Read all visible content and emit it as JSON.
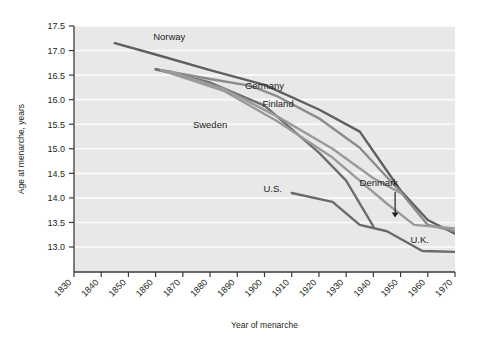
{
  "chart_data": {
    "type": "line",
    "title": "",
    "xlabel": "Year of menarche",
    "ylabel": "Age at menarche, years",
    "xlim": [
      1830,
      1970
    ],
    "ylim": [
      12.7,
      17.6
    ],
    "xticks": [
      1830,
      1840,
      1850,
      1860,
      1870,
      1880,
      1890,
      1900,
      1910,
      1920,
      1930,
      1940,
      1950,
      1960,
      1970
    ],
    "yticks": [
      13.0,
      13.5,
      14.0,
      14.5,
      15.0,
      15.5,
      16.0,
      16.5,
      17.0,
      17.5
    ],
    "grid": "horizontal-major-white",
    "plot_background": "#e8e8e8",
    "legend": "inline-labels",
    "series": [
      {
        "name": "Norway",
        "color": "#5f5f5f",
        "label_x": 1865,
        "label_y": 17.22,
        "x": [
          1845,
          1860,
          1880,
          1900,
          1920,
          1935,
          1950,
          1960,
          1970
        ],
        "y": [
          17.15,
          16.92,
          16.6,
          16.3,
          15.8,
          15.35,
          14.15,
          13.55,
          13.27
        ]
      },
      {
        "name": "Sweden",
        "color": "#8c8c8c",
        "label_x": 1880,
        "label_y": 15.42,
        "x": [
          1860,
          1880,
          1895,
          1905,
          1920,
          1935,
          1950,
          1960,
          1970
        ],
        "y": [
          16.62,
          16.42,
          16.28,
          16.06,
          15.62,
          15.02,
          14.12,
          13.45,
          13.32
        ]
      },
      {
        "name": "Germany",
        "color": "#6e6e6e",
        "label_x": 1900,
        "label_y": 16.22,
        "x": [
          1860,
          1880,
          1900,
          1920,
          1930,
          1940
        ],
        "y": [
          16.62,
          16.35,
          15.88,
          14.92,
          14.35,
          13.42
        ]
      },
      {
        "name": "Finland",
        "color": "#9a9a9a",
        "label_x": 1905,
        "label_y": 15.86,
        "x": [
          1865,
          1885,
          1905,
          1925,
          1940,
          1950
        ],
        "y": [
          16.58,
          16.22,
          15.65,
          15.0,
          14.4,
          14.1
        ]
      },
      {
        "name": "Denmark",
        "color": "#9a9a9a",
        "label_x": 1942,
        "label_y": 14.25,
        "arrow": true,
        "x": [
          1862,
          1885,
          1905,
          1925,
          1945,
          1955,
          1970
        ],
        "y": [
          16.6,
          16.18,
          15.55,
          14.82,
          13.88,
          13.45,
          13.38
        ]
      },
      {
        "name": "U.S.",
        "color": "#6a6a6a",
        "label_x": 1903,
        "label_y": 14.12,
        "x": [
          1910,
          1925,
          1935,
          1945,
          1958,
          1970
        ],
        "y": [
          14.1,
          13.92,
          13.45,
          13.32,
          12.92,
          12.9
        ]
      }
    ]
  },
  "labels": {
    "norway": "Norway",
    "sweden": "Sweden",
    "germany": "Germany",
    "finland": "Finland",
    "denmark": "Denmark",
    "us": "U.S.",
    "uk": "U.K."
  },
  "uk_label": {
    "text": "U.K.",
    "x": 1957,
    "y": 13.08
  },
  "axis": {
    "x_title": "Year of menarche",
    "y_title": "Age at menarche, years"
  },
  "xtick_labels": [
    "1830",
    "1840",
    "1850",
    "1860",
    "1870",
    "1880",
    "1890",
    "1900",
    "1910",
    "1920",
    "1930",
    "1940",
    "1950",
    "1960",
    "1970"
  ],
  "ytick_labels": [
    "17.5",
    "17.0",
    "16.5",
    "16.0",
    "15.5",
    "15.0",
    "14.5",
    "14.0",
    "13.5",
    "13.0"
  ]
}
